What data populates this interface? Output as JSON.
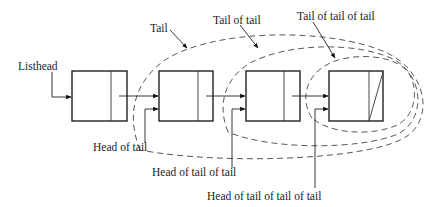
{
  "diagram": {
    "labels": {
      "listhead": "Listhead",
      "tail": "Tail",
      "tail_of_tail": "Tail of tail",
      "tail_of_tail_of_tail": "Tail of tail of tail",
      "head_of_tail": "Head of tail",
      "head_of_tail_of_tail": "Head of tail of tail",
      "head_of_tail_of_tail_of_tail": "Head of tail of tail of tail"
    },
    "nodes": [
      {
        "id": "node-1",
        "has_null_pointer": false
      },
      {
        "id": "node-2",
        "has_null_pointer": false
      },
      {
        "id": "node-3",
        "has_null_pointer": false
      },
      {
        "id": "node-4",
        "has_null_pointer": true
      }
    ],
    "colors": {
      "stroke": "#222222",
      "dashed": "#444444",
      "background": "#ffffff"
    }
  }
}
